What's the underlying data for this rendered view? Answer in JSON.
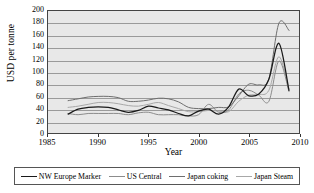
{
  "chart_data": {
    "type": "line",
    "title": "",
    "xlabel": "Year",
    "ylabel": "USD per tonne",
    "xlim": [
      1985,
      2010
    ],
    "ylim": [
      0,
      200
    ],
    "xticks": [
      1985,
      1990,
      1995,
      2000,
      2005,
      2010
    ],
    "yticks": [
      0,
      20,
      40,
      60,
      80,
      100,
      120,
      140,
      160,
      180,
      200
    ],
    "grid": "horizontal",
    "legend_position": "bottom",
    "plot_background": "#e8e8e8",
    "series": [
      {
        "name": "NW Europe Marker",
        "color": "#1a1a1a",
        "x": [
          1987,
          1988,
          1989,
          1990,
          1991,
          1992,
          1993,
          1994,
          1995,
          1996,
          1997,
          1998,
          1999,
          2000,
          2001,
          2002,
          2003,
          2004,
          2005,
          2006,
          2007,
          2008,
          2009
        ],
        "y": [
          31,
          39,
          42,
          43,
          42,
          38,
          34,
          37,
          44,
          41,
          38,
          32,
          28,
          36,
          39,
          31,
          43,
          72,
          61,
          64,
          88,
          147,
          70
        ]
      },
      {
        "name": "US Central",
        "color": "#8c8c8c",
        "x": [
          1987,
          1988,
          1989,
          1990,
          1991,
          1992,
          1993,
          1994,
          1995,
          1996,
          1997,
          1998,
          1999,
          2000,
          2001,
          2002,
          2003,
          2004,
          2005,
          2006,
          2007,
          2008,
          2009
        ],
        "y": [
          32,
          30,
          32,
          32,
          32,
          32,
          30,
          33,
          34,
          30,
          30,
          30,
          28,
          30,
          47,
          34,
          38,
          64,
          70,
          62,
          52,
          118,
          68
        ]
      },
      {
        "name": "Japan coking",
        "color": "#6e6e6e",
        "x": [
          1987,
          1988,
          1989,
          1990,
          1991,
          1992,
          1993,
          1994,
          1995,
          1996,
          1997,
          1998,
          1999,
          2000,
          2001,
          2002,
          2003,
          2004,
          2005,
          2006,
          2007,
          2008,
          2009
        ],
        "y": [
          53,
          56,
          59,
          60,
          60,
          58,
          52,
          52,
          54,
          57,
          56,
          51,
          42,
          40,
          40,
          42,
          43,
          61,
          80,
          79,
          89,
          180,
          168
        ]
      },
      {
        "name": "Japan Steam",
        "color": "#a8a8a8",
        "x": [
          1987,
          1988,
          1989,
          1990,
          1991,
          1992,
          1993,
          1994,
          1995,
          1996,
          1997,
          1998,
          1999,
          2000,
          2001,
          2002,
          2003,
          2004,
          2005,
          2006,
          2007,
          2008,
          2009
        ],
        "y": [
          42,
          44,
          47,
          50,
          50,
          48,
          45,
          44,
          47,
          50,
          45,
          40,
          35,
          35,
          37,
          36,
          35,
          52,
          62,
          63,
          70,
          125,
          72
        ]
      }
    ]
  },
  "axes": {
    "ylabel": "USD per tonne",
    "xlabel": "Year",
    "ytick_labels": [
      "200",
      "180",
      "160",
      "140",
      "120",
      "100",
      "80",
      "60",
      "40",
      "20",
      "0"
    ],
    "xtick_labels": [
      "1985",
      "1990",
      "1995",
      "2000",
      "2005",
      "2010"
    ]
  },
  "legend": {
    "items": [
      {
        "label": "NW Europe Marker",
        "color": "#1a1a1a"
      },
      {
        "label": "US Central",
        "color": "#8c8c8c"
      },
      {
        "label": "Japan coking",
        "color": "#6e6e6e"
      },
      {
        "label": "Japan Steam",
        "color": "#a8a8a8"
      }
    ]
  }
}
